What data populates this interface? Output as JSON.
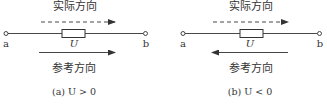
{
  "diagrams": [
    {
      "id": "a",
      "actual_label": "实际方向",
      "reference_label": "参考方向",
      "terminal_left": "a",
      "terminal_right": "b",
      "element_label": "U",
      "caption": "(a)  U > 0",
      "actual_direction": "right",
      "reference_direction": "right"
    },
    {
      "id": "b",
      "actual_label": "实际方向",
      "reference_label": "参考方向",
      "terminal_left": "a",
      "terminal_right": "b",
      "element_label": "U",
      "caption": "(b)  U < 0",
      "actual_direction": "right",
      "reference_direction": "left"
    }
  ]
}
